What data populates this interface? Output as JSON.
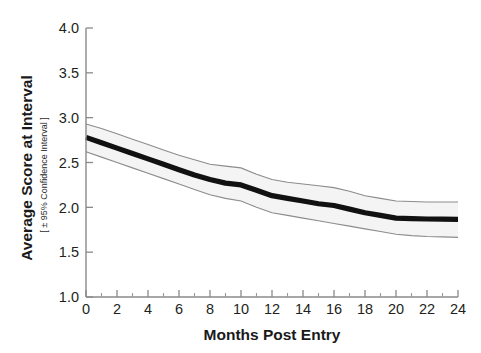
{
  "figure": {
    "background_color": "#ffffff",
    "mean_line_color": "#111111",
    "band_fill_color": "#f4f4f4",
    "band_edge_color": "#8c8c8c",
    "axis_color": "#8a8a8a"
  },
  "chart_data": {
    "type": "line",
    "title": "",
    "subtitle": "",
    "xlabel": "Months Post Entry",
    "ylabel": "Average Score at Interval",
    "ylabel_sub": "[ ± 95% Confidence Interval ]",
    "xlim": [
      0,
      24
    ],
    "ylim": [
      1.0,
      4.0
    ],
    "grid": false,
    "legend": null,
    "xticks": [
      0,
      2,
      4,
      6,
      8,
      10,
      12,
      14,
      16,
      18,
      20,
      22,
      24
    ],
    "xtick_labels": [
      "0",
      "2",
      "4",
      "6",
      "8",
      "10",
      "12",
      "14",
      "16",
      "18",
      "20",
      "22",
      "24"
    ],
    "xminor_ticks": [
      1,
      3,
      5,
      7,
      9,
      11,
      13,
      15,
      17,
      19,
      21,
      23
    ],
    "yticks": [
      1.0,
      1.5,
      2.0,
      2.5,
      3.0,
      3.5,
      4.0
    ],
    "ytick_labels": [
      "1.0",
      "1.5",
      "2.0",
      "2.5",
      "3.0",
      "3.5",
      "4.0"
    ],
    "x": [
      0,
      1,
      2,
      3,
      4,
      5,
      6,
      7,
      8,
      9,
      10,
      11,
      12,
      13,
      14,
      15,
      16,
      17,
      18,
      19,
      20,
      21,
      22,
      23,
      24
    ],
    "series": [
      {
        "name": "Average Score at Interval",
        "role": "mean",
        "values": [
          2.78,
          2.72,
          2.66,
          2.6,
          2.54,
          2.48,
          2.42,
          2.36,
          2.31,
          2.27,
          2.25,
          2.19,
          2.13,
          2.1,
          2.07,
          2.04,
          2.02,
          1.98,
          1.94,
          1.91,
          1.88,
          1.875,
          1.87,
          1.868,
          1.865
        ]
      },
      {
        "name": "Upper 95% confidence limit",
        "role": "ci_upper",
        "values": [
          2.93,
          2.88,
          2.82,
          2.76,
          2.7,
          2.64,
          2.58,
          2.53,
          2.48,
          2.46,
          2.44,
          2.37,
          2.31,
          2.28,
          2.26,
          2.24,
          2.22,
          2.18,
          2.13,
          2.1,
          2.07,
          2.065,
          2.06,
          2.06,
          2.06
        ]
      },
      {
        "name": "Lower 95% confidence limit",
        "role": "ci_lower",
        "values": [
          2.62,
          2.56,
          2.5,
          2.44,
          2.38,
          2.32,
          2.26,
          2.2,
          2.14,
          2.1,
          2.07,
          2.0,
          1.94,
          1.91,
          1.88,
          1.85,
          1.82,
          1.79,
          1.76,
          1.73,
          1.7,
          1.685,
          1.675,
          1.67,
          1.665
        ]
      }
    ]
  }
}
